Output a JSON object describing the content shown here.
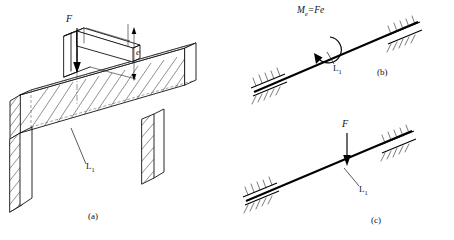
{
  "figure": {
    "background_color": "#ffffff",
    "line_color": "#111111"
  },
  "panel_a": {
    "caption": "(a)",
    "force_label": "F",
    "eccentricity_label": "e",
    "beam_label": "L",
    "beam_label_sub": "1",
    "description": "Isometric view of bracket welded on beam with eccentric vertical load"
  },
  "panel_b": {
    "caption": "(b)",
    "moment_label_main": "M",
    "moment_label_sub": "e",
    "moment_label_rest": "=Fe",
    "moment_label_full": "Me=Fe",
    "beam_label": "L",
    "beam_label_sub": "1",
    "description": "Equivalent couple moment applied to beam"
  },
  "panel_c": {
    "caption": "(c)",
    "force_label": "F",
    "beam_label": "L",
    "beam_label_sub": "1",
    "description": "Equivalent concentrated force applied to beam"
  }
}
